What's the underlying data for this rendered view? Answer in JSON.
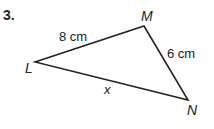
{
  "problem": {
    "number": "3."
  },
  "triangle": {
    "vertices": {
      "L": {
        "label": "L",
        "x": 35,
        "y": 62
      },
      "M": {
        "label": "M",
        "x": 144,
        "y": 26
      },
      "N": {
        "label": "N",
        "x": 188,
        "y": 100
      }
    },
    "sides": {
      "LM": {
        "label": "8 cm"
      },
      "MN": {
        "label": "6 cm"
      },
      "LN": {
        "label": "x"
      }
    },
    "stroke_color": "#222222"
  }
}
